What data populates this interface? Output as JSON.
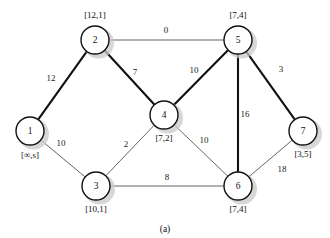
{
  "figure": {
    "caption": "(a)",
    "corner_mark": "",
    "type": "weighted-undirected-graph",
    "colors": {
      "background": "#ffffff",
      "node_stroke": "#111111",
      "node_fill": "#ffffff",
      "tree_edge": "#111111",
      "plain_edge": "#4a4a4a",
      "shadow": "#c9c9c9"
    }
  },
  "nodes": [
    {
      "id": "1",
      "label": "[∞,s]",
      "x": 30,
      "y": 131,
      "r": 14,
      "label_x": 30,
      "label_y": 158
    },
    {
      "id": "2",
      "label": "[12,1]",
      "x": 95,
      "y": 40,
      "r": 14,
      "label_x": 95,
      "label_y": 18
    },
    {
      "id": "3",
      "label": "[10,1]",
      "x": 96,
      "y": 186,
      "r": 14,
      "label_x": 96,
      "label_y": 212
    },
    {
      "id": "4",
      "label": "[7,2]",
      "x": 164,
      "y": 115,
      "r": 14,
      "label_x": 164,
      "label_y": 141
    },
    {
      "id": "5",
      "label": "[7,4]",
      "x": 238,
      "y": 40,
      "r": 14,
      "label_x": 238,
      "label_y": 18
    },
    {
      "id": "6",
      "label": "[7,4]",
      "x": 238,
      "y": 186,
      "r": 14,
      "label_x": 238,
      "label_y": 212
    },
    {
      "id": "7",
      "label": "[3,5]",
      "x": 303,
      "y": 131,
      "r": 14,
      "label_x": 303,
      "label_y": 157
    }
  ],
  "edges": [
    {
      "from": "1",
      "to": "2",
      "weight": "12",
      "style": "thick",
      "label_x": 51,
      "label_y": 81
    },
    {
      "from": "1",
      "to": "3",
      "weight": "10",
      "style": "thin",
      "label_x": 61,
      "label_y": 146
    },
    {
      "from": "2",
      "to": "5",
      "weight": "0",
      "style": "thin",
      "label_x": 166,
      "label_y": 33
    },
    {
      "from": "2",
      "to": "4",
      "weight": "7",
      "style": "thick",
      "label_x": 135,
      "label_y": 75
    },
    {
      "from": "3",
      "to": "4",
      "weight": "2",
      "style": "thin",
      "label_x": 126,
      "label_y": 147
    },
    {
      "from": "3",
      "to": "6",
      "weight": "8",
      "style": "thin",
      "label_x": 167,
      "label_y": 180
    },
    {
      "from": "4",
      "to": "5",
      "weight": "10",
      "style": "thick",
      "label_x": 194,
      "label_y": 73
    },
    {
      "from": "4",
      "to": "6",
      "weight": "10",
      "style": "thin",
      "label_x": 204,
      "label_y": 143
    },
    {
      "from": "5",
      "to": "6",
      "weight": "16",
      "style": "thick",
      "label_x": 245,
      "label_y": 117
    },
    {
      "from": "5",
      "to": "7",
      "weight": "3",
      "style": "thick",
      "label_x": 281,
      "label_y": 72
    },
    {
      "from": "6",
      "to": "7",
      "weight": "18",
      "style": "thin",
      "label_x": 282,
      "label_y": 172
    }
  ]
}
